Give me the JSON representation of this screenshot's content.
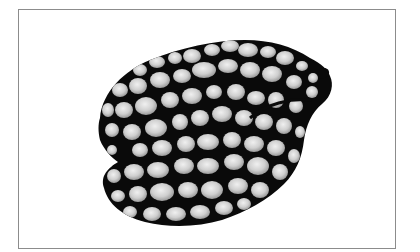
{
  "image": {
    "subject": "patterned sea snail shell",
    "alt": "Black shell with a net-like pattern of pale gray rounded spots on a white background, enclosed in a thin gray frame",
    "colors": {
      "background": "#ffffff",
      "frame_border": "#8c8c8c",
      "shell_dark": "#0a0a0a",
      "spot_light": "#d6d6d6",
      "spot_highlight": "#eeeeee"
    }
  }
}
